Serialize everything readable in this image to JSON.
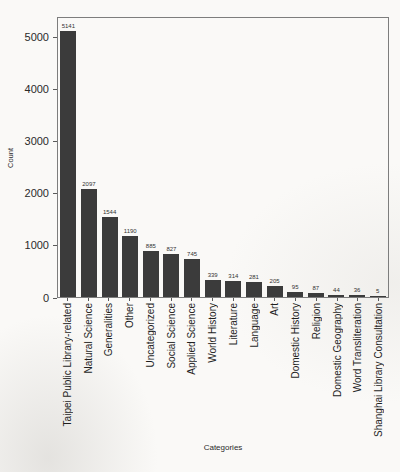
{
  "chart_data": {
    "type": "bar",
    "title": "",
    "xlabel": "Categories",
    "ylabel": "Count",
    "categories": [
      "Taipei Public Library-related",
      "Natural Science",
      "Generalities",
      "Other",
      "Uncategorized",
      "Social Science",
      "Applied Science",
      "World History",
      "Literature",
      "Language",
      "Art",
      "Domestic History",
      "Religion",
      "Domestic Geography",
      "Word Transliteration",
      "Shanghai Library Consultation"
    ],
    "values": [
      5141,
      2097,
      1544,
      1190,
      885,
      827,
      745,
      339,
      314,
      281,
      205,
      95,
      87,
      44,
      36,
      5
    ],
    "value_labels_shown": true,
    "bar_color": "#3b3b3b",
    "ylim": [
      0,
      5400
    ],
    "yticks": [
      0,
      1000,
      2000,
      3000,
      4000,
      5000
    ],
    "grid": false,
    "legend_position": "none",
    "x_tick_label_rotation_deg": 90
  }
}
